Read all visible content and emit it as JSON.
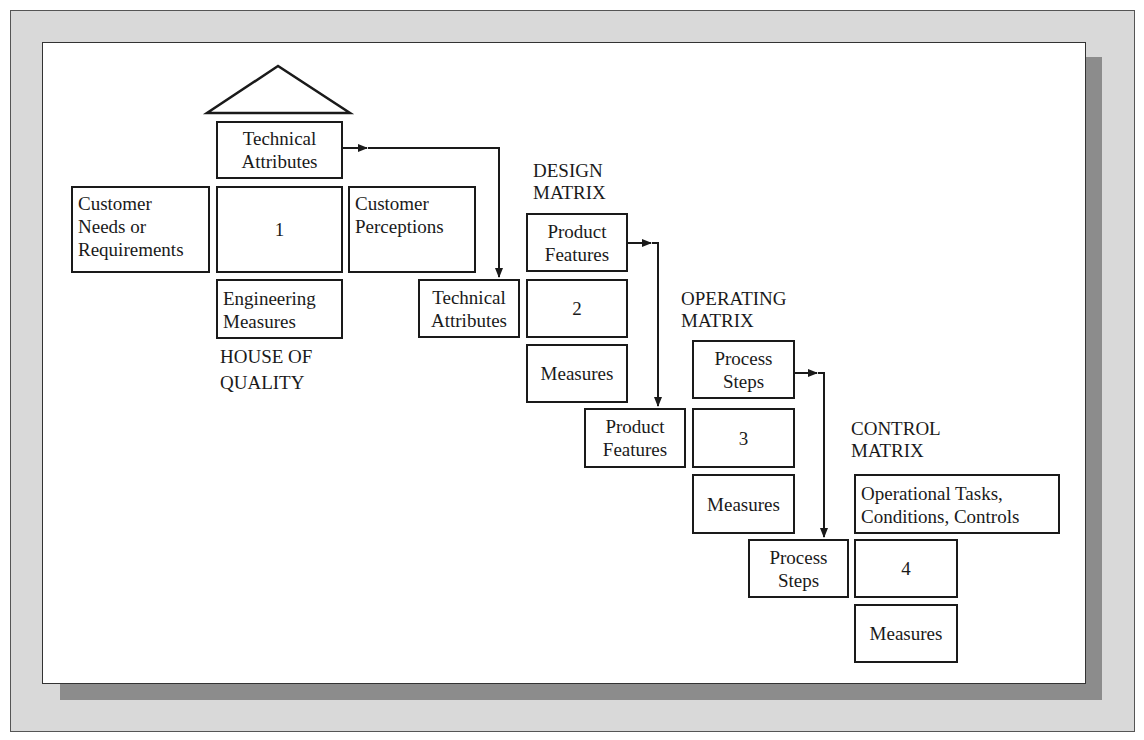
{
  "diagram": {
    "type": "QFD four-matrix cascade",
    "stage1": {
      "title_line1": "HOUSE OF",
      "title_line2": "QUALITY",
      "roof": "roof-triangle",
      "top_box": {
        "line1": "Technical",
        "line2": "Attributes"
      },
      "left_box": {
        "line1": "Customer",
        "line2": "Needs or",
        "line3": "Requirements"
      },
      "center_box": {
        "value": "1"
      },
      "right_box": {
        "line1": "Customer",
        "line2": "Perceptions"
      },
      "bottom_box": {
        "line1": "Engineering",
        "line2": "Measures"
      }
    },
    "stage2": {
      "title_line1": "DESIGN",
      "title_line2": "MATRIX",
      "top_box": {
        "line1": "Product",
        "line2": "Features"
      },
      "left_box": {
        "line1": "Technical",
        "line2": "Attributes"
      },
      "center_box": {
        "value": "2"
      },
      "bottom_box": {
        "line1": "Measures"
      }
    },
    "stage3": {
      "title_line1": "OPERATING",
      "title_line2": "MATRIX",
      "top_box": {
        "line1": "Process",
        "line2": "Steps"
      },
      "left_box": {
        "line1": "Product",
        "line2": "Features"
      },
      "center_box": {
        "value": "3"
      },
      "bottom_box": {
        "line1": "Measures"
      }
    },
    "stage4": {
      "title_line1": "CONTROL",
      "title_line2": "MATRIX",
      "top_box": {
        "line1": "Operational Tasks,",
        "line2": "Conditions, Controls"
      },
      "left_box": {
        "line1": "Process",
        "line2": "Steps"
      },
      "center_box": {
        "value": "4"
      },
      "bottom_box": {
        "line1": "Measures"
      }
    },
    "connectors": [
      {
        "from": "stage1.top_box",
        "to": "stage2.left_box"
      },
      {
        "from": "stage2.top_box",
        "to": "stage3.left_box"
      },
      {
        "from": "stage3.top_box",
        "to": "stage4.left_box"
      }
    ],
    "colors": {
      "frame_bg": "#d9d9d9",
      "shadow": "#8c8c8c",
      "panel": "#ffffff",
      "stroke": "#1a1a1a"
    }
  }
}
